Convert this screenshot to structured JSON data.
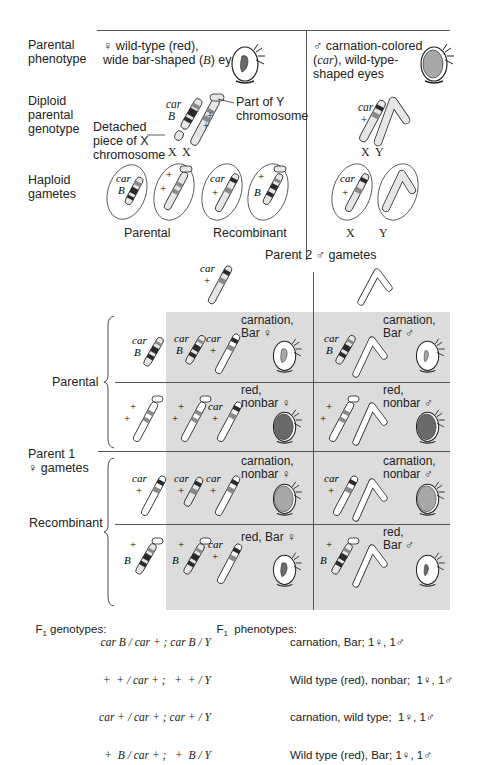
{
  "header": {
    "row_labels": {
      "parental_phenotype": [
        "Parental",
        "phenotype"
      ],
      "diploid_genotype": [
        "Diploid",
        "parental",
        "genotype"
      ],
      "haploid_gametes": [
        "Haploid",
        "gametes"
      ]
    },
    "female_phenotype": {
      "symbol": "♀",
      "line1": "wild-type (red),",
      "line2_pre": "wide bar-shaped (",
      "line2_allele": "B",
      "line2_post": ") eyes"
    },
    "male_phenotype": {
      "symbol": "♂",
      "line1": "carnation-colored",
      "line2_pre": "(",
      "line2_allele": "car",
      "line2_post": "), wild-type-",
      "line3": "shaped eyes"
    },
    "annotations": {
      "part_of_y": [
        "Part of Y",
        "chromosome"
      ],
      "detached_x": [
        "Detached",
        "piece of X",
        "chromosome"
      ]
    },
    "chromosome_labels": {
      "x": "X",
      "y": "Y",
      "car": "car",
      "b": "B",
      "plus": "+"
    },
    "gamete_groups": {
      "parental": "Parental",
      "recombinant": "Recombinant"
    }
  },
  "punnett": {
    "column_header": "Parent 2 ♂ gametes",
    "row_header": [
      "Parent 1",
      "♀ gametes"
    ],
    "row_groups": {
      "parental": "Parental",
      "recombinant": "Recombinant"
    },
    "cells": [
      {
        "female": [
          "carnation,",
          "Bar ♀"
        ],
        "male": [
          "carnation,",
          "Bar ♂"
        ]
      },
      {
        "female": [
          "red,",
          "nonbar ♀"
        ],
        "male": [
          "red,",
          "nonbar ♂"
        ]
      },
      {
        "female": [
          "carnation,",
          "nonbar ♀"
        ],
        "male": [
          "carnation,",
          "nonbar ♂"
        ]
      },
      {
        "female": [
          "red, Bar ♀"
        ],
        "male": [
          "red,",
          "Bar ♂"
        ]
      }
    ]
  },
  "summary": {
    "genotypes_label": "F",
    "genotypes_sub": "1",
    "genotypes_title": " genotypes:",
    "genotypes": [
      "car B / car + ; car B / Y",
      "  +  + / car + ;   +  + / Y",
      "car + / car + ; car + / Y",
      "  +  B / car + ;   +  B / Y"
    ],
    "phenotypes_label": "F",
    "phenotypes_sub": "1",
    "phenotypes_title": "  phenotypes:",
    "phenotypes": [
      "carnation, Bar; 1♀, 1♂",
      "Wild type (red), nonbar;  1♀, 1♂",
      "carnation, wild type;  1♀, 1♂",
      "Wild type (red), Bar; 1♀, 1♂"
    ]
  },
  "colors": {
    "shade": "#dcdcdc",
    "line": "#555555",
    "chromosome_fill": "#e6e6e6",
    "band_dark": "#2a2a2a",
    "band_mid": "#8a8a8a",
    "eye_red": "#6a6a6a",
    "eye_carnation": "#a8a8a8"
  }
}
